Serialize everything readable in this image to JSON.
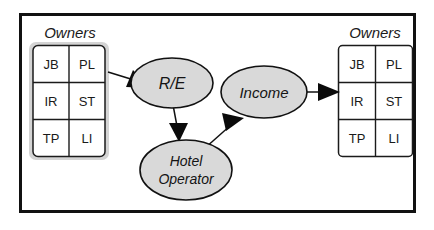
{
  "diagram": {
    "background_color": "#ffffff",
    "frame": {
      "name": "outer-frame",
      "border_color": "#111111"
    },
    "colors": {
      "node_fill": "#d9d9d9",
      "node_stroke": "#111111",
      "table_fill": "#ffffff",
      "table_stroke": "#1b1b1b",
      "shadow_fill": "#d4d4d4",
      "text": "#1a1a1a",
      "arrow": "#0a0a0a"
    },
    "tables": [
      {
        "id": "owners-left",
        "label": "Owners",
        "has_shadow": true,
        "rows": [
          [
            "JB",
            "PL"
          ],
          [
            "IR",
            "ST"
          ],
          [
            "TP",
            "LI"
          ]
        ]
      },
      {
        "id": "owners-right",
        "label": "Owners",
        "has_shadow": false,
        "rows": [
          [
            "JB",
            "PL"
          ],
          [
            "IR",
            "ST"
          ],
          [
            "TP",
            "LI"
          ]
        ]
      }
    ],
    "nodes": [
      {
        "id": "re",
        "label": "R/E",
        "lines": [
          "R/E"
        ],
        "shape": "ellipse"
      },
      {
        "id": "income",
        "label": "Income",
        "lines": [
          "Income"
        ],
        "shape": "ellipse"
      },
      {
        "id": "hotel-operator",
        "label": "Hotel Operator",
        "lines": [
          "Hotel",
          "Operator"
        ],
        "shape": "ellipse"
      }
    ],
    "edges": [
      {
        "id": "owners-left-to-re",
        "from": "owners-left",
        "to": "re",
        "arrow": "to"
      },
      {
        "id": "re-to-hotel-operator",
        "from": "re",
        "to": "hotel-operator",
        "arrow": "to"
      },
      {
        "id": "hotel-operator-to-income",
        "from": "hotel-operator",
        "to": "income",
        "arrow": "to"
      },
      {
        "id": "income-to-owners-right",
        "from": "income",
        "to": "owners-right",
        "arrow": "to"
      }
    ]
  }
}
